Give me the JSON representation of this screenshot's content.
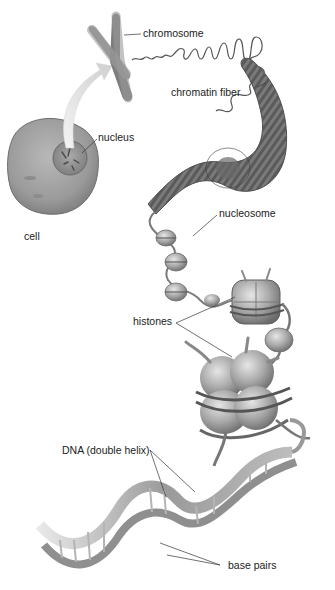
{
  "figure": {
    "style": "grayscale illustration",
    "background": "#ffffff"
  },
  "labels": {
    "chromosome": "chromosome",
    "chromatin_fiber": "chromatin fiber",
    "nucleus": "nucleus",
    "cell": "cell",
    "nucleosome": "nucleosome",
    "histones": "histones",
    "dna": "DNA (double helix)",
    "base_pairs": "base pairs"
  },
  "structures": [
    {
      "name": "cell",
      "label_key": "cell"
    },
    {
      "name": "nucleus",
      "label_key": "nucleus"
    },
    {
      "name": "chromosome",
      "label_key": "chromosome"
    },
    {
      "name": "chromatin fiber",
      "label_key": "chromatin_fiber"
    },
    {
      "name": "nucleosome",
      "label_key": "nucleosome"
    },
    {
      "name": "histones",
      "label_key": "histones"
    },
    {
      "name": "DNA (double helix)",
      "label_key": "dna"
    },
    {
      "name": "base pairs",
      "label_key": "base_pairs"
    }
  ]
}
